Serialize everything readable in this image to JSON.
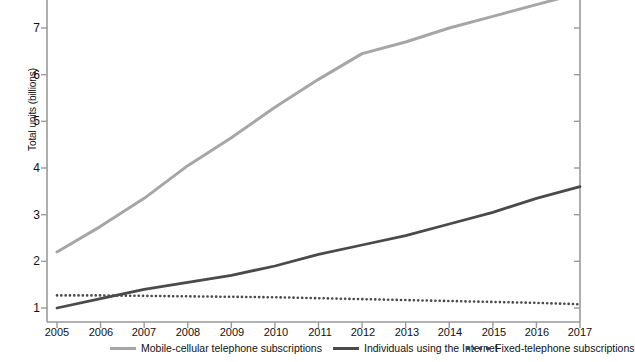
{
  "chart_data": {
    "type": "line",
    "title": "",
    "xlabel": "",
    "ylabel": "Total units (billions)",
    "x": [
      2005,
      2006,
      2007,
      2008,
      2009,
      2010,
      2011,
      2012,
      2013,
      2014,
      2015,
      2016,
      2017
    ],
    "xtick_labels": [
      "2005",
      "2006",
      "2007",
      "2008",
      "2009",
      "2010",
      "2011",
      "2012",
      "2013",
      "2014",
      "2015",
      "2016",
      "2017"
    ],
    "ytick_labels": [
      "1",
      "2",
      "3",
      "4",
      "5",
      "6",
      "7"
    ],
    "ytick_values": [
      1,
      2,
      3,
      4,
      5,
      6,
      7
    ],
    "ylim": [
      0.6,
      7.7
    ],
    "xlim": [
      2005,
      2017
    ],
    "grid": false,
    "legend_position": "bottom",
    "series": [
      {
        "name": "Mobile-cellular telephone subscriptions",
        "style": "solid",
        "color": "#a6a6a6",
        "values": [
          2.2,
          2.75,
          3.35,
          4.05,
          4.65,
          5.3,
          5.9,
          6.45,
          6.7,
          7.0,
          7.25,
          7.5,
          7.75
        ]
      },
      {
        "name": "Individuals using the Internet",
        "style": "solid",
        "color": "#4a4a4a",
        "values": [
          1.0,
          1.2,
          1.4,
          1.55,
          1.7,
          1.9,
          2.15,
          2.35,
          2.55,
          2.8,
          3.05,
          3.35,
          3.6
        ]
      },
      {
        "name": "Fixed-telephone subscriptions",
        "style": "dotted",
        "color": "#4a4a4a",
        "values": [
          1.27,
          1.27,
          1.26,
          1.25,
          1.24,
          1.23,
          1.21,
          1.19,
          1.17,
          1.15,
          1.13,
          1.11,
          1.08
        ]
      }
    ]
  },
  "axis": {
    "ylabel": "Total units (billions)",
    "ytick_1": "1",
    "ytick_2": "2",
    "ytick_3": "3",
    "ytick_4": "4",
    "ytick_5": "5",
    "ytick_6": "6",
    "ytick_7": "7",
    "xtick_2005": "2005",
    "xtick_2006": "2006",
    "xtick_2007": "2007",
    "xtick_2008": "2008",
    "xtick_2009": "2009",
    "xtick_2010": "2010",
    "xtick_2011": "2011",
    "xtick_2012": "2012",
    "xtick_2013": "2013",
    "xtick_2014": "2014",
    "xtick_2015": "2015",
    "xtick_2016": "2016",
    "xtick_2017": "2017"
  },
  "legend": {
    "items": [
      {
        "label": "Mobile-cellular telephone subscriptions",
        "style": "solid-light"
      },
      {
        "label": "Individuals using the Internet",
        "style": "solid-dark"
      },
      {
        "label": "Fixed-telephone subscriptions",
        "style": "dotted"
      }
    ]
  },
  "colors": {
    "mobile": "#a6a6a6",
    "internet": "#4a4a4a",
    "fixed": "#4a4a4a",
    "axis": "#999999",
    "text": "#111111"
  }
}
